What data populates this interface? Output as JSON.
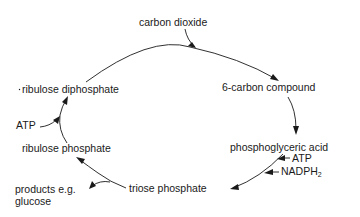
{
  "diagram": {
    "type": "cycle",
    "nodes": {
      "carbon_dioxide": "carbon dioxide",
      "six_carbon": "6-carbon compound",
      "pga": "phosphoglyceric acid",
      "triose": "triose phosphate",
      "ribulose_phosphate": "ribulose phosphate",
      "ribulose_diphosphate": "ribulose diphosphate",
      "products_line1": "products e.g.",
      "products_line2": "glucose"
    },
    "inputs": {
      "atp_pga": "ATP",
      "nadph_main": "NADPH",
      "nadph_sub": "2",
      "atp_ribulose": "ATP"
    },
    "edges": [
      {
        "from": "carbon dioxide",
        "to": "cycle (joins ribulose diphosphate)"
      },
      {
        "from": "ribulose diphosphate",
        "to": "6-carbon compound"
      },
      {
        "from": "6-carbon compound",
        "to": "phosphoglyceric acid"
      },
      {
        "from": "phosphoglyceric acid",
        "to": "triose phosphate",
        "inputs": [
          "ATP",
          "NADPH2"
        ]
      },
      {
        "from": "triose phosphate",
        "to": "ribulose phosphate"
      },
      {
        "from": "triose phosphate",
        "to": "products e.g. glucose"
      },
      {
        "from": "ribulose phosphate",
        "to": "ribulose diphosphate",
        "inputs": [
          "ATP"
        ]
      }
    ]
  }
}
